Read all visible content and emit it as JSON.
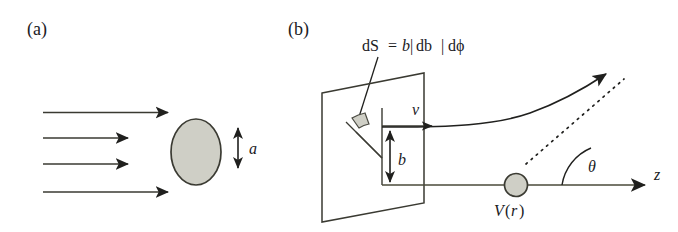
{
  "figure": {
    "kind": "scattering-cross-section-diagram",
    "background_color": "#ffffff",
    "ink_color": "#20201e",
    "line_color": "#3a3a32",
    "fill_gray": "#cfcfc6",
    "panels": [
      {
        "id": "a",
        "label": "(a)",
        "description": "Uniform parallel beam incident on an obstacle of size a",
        "annotations": [
          {
            "name": "size-label",
            "text": "a"
          }
        ],
        "beam_arrow_count": 4
      },
      {
        "id": "b",
        "label": "(b)",
        "description": "Single-particle scattering off a central potential with impact parameter b",
        "annotations": [
          {
            "name": "area-element-formula",
            "text": "dS = b |db| dϕ"
          },
          {
            "name": "velocity-label",
            "text": "v"
          },
          {
            "name": "impact-parameter-label",
            "text": "b"
          },
          {
            "name": "scattering-angle-label",
            "text": "θ"
          },
          {
            "name": "axis-label",
            "text": "z"
          },
          {
            "name": "potential-label",
            "text": "V(r)"
          }
        ]
      }
    ]
  },
  "panel_a": {
    "label": "(a)",
    "size_label": "a"
  },
  "panel_b": {
    "label": "(b)",
    "formula_dS": "dS",
    "formula_eq": "=",
    "formula_b": "b",
    "formula_bar1": "|",
    "formula_db": "db",
    "formula_bar2": "|",
    "formula_dphi": "dϕ",
    "velocity_label": "v",
    "impact_parameter_label": "b",
    "theta_label": "θ",
    "axis_label": "z",
    "potential_label_v": "V",
    "potential_label_paren_open": "(",
    "potential_label_r": "r",
    "potential_label_paren_close": ")"
  },
  "colors": {
    "ink": "#20201e",
    "stroke": "#3a3a32",
    "shade": "#cfcfc6",
    "shade_edge": "#55554c",
    "background": "#ffffff"
  }
}
